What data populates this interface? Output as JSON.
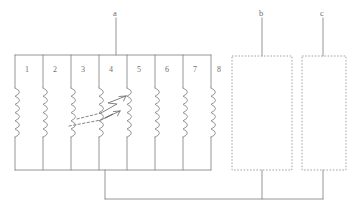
{
  "diagram": {
    "line_color": "#8a8a8a",
    "dash_color": "#9a9a9a",
    "text_color": "#6e6e6e",
    "background": "#ffffff",
    "coil_array": {
      "name": "coil-bank",
      "cell_labels": [
        "1",
        "2",
        "3",
        "4",
        "5",
        "6",
        "7",
        "8"
      ],
      "coil_count": 8
    },
    "callouts": [
      {
        "id": "a",
        "label": "a",
        "target": "coil-bank-top-rail"
      },
      {
        "id": "b",
        "label": "b",
        "target": "dashed-box-b"
      },
      {
        "id": "c",
        "label": "c",
        "target": "dashed-box-c"
      }
    ],
    "dashed_boxes": [
      {
        "id": "b",
        "label": "b"
      },
      {
        "id": "c",
        "label": "c"
      }
    ],
    "fault_arrows": {
      "name": "zigzag-fault-arrows",
      "count": 2,
      "direction": "up-right",
      "from_coil": "3",
      "to_coil": "5"
    },
    "bus": {
      "name": "bottom-bus-wire",
      "connects": [
        "coil-bank",
        "dashed-box-b",
        "dashed-box-c"
      ]
    }
  }
}
